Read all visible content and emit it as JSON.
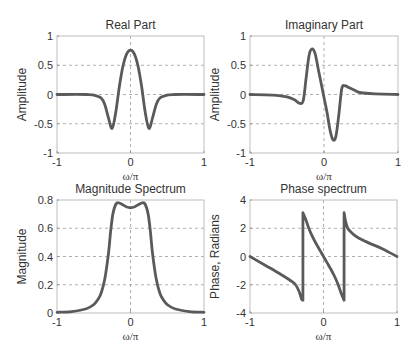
{
  "chart_data": [
    {
      "type": "line",
      "title": "Real Part",
      "xlabel": "ω/π",
      "ylabel": "Amplitude",
      "xlim": [
        -1,
        1
      ],
      "ylim": [
        -1,
        1
      ],
      "xticks": [
        -1,
        0,
        1
      ],
      "yticks": [
        -1,
        -0.5,
        0,
        0.5,
        1
      ],
      "ytick_labels": [
        "-1",
        "-0.5",
        "0",
        "0.5",
        "1"
      ],
      "xtick_labels": [
        "-1",
        "0",
        "1"
      ],
      "grid": true,
      "series": [
        {
          "name": "real",
          "x": [
            -1,
            -0.6,
            -0.5,
            -0.4,
            -0.35,
            -0.3,
            -0.25,
            -0.2,
            -0.15,
            -0.1,
            -0.05,
            0,
            0.05,
            0.1,
            0.15,
            0.2,
            0.25,
            0.3,
            0.35,
            0.4,
            0.5,
            0.6,
            1
          ],
          "y": [
            0,
            0,
            -0.01,
            -0.06,
            -0.17,
            -0.4,
            -0.58,
            -0.3,
            0.15,
            0.5,
            0.7,
            0.76,
            0.7,
            0.5,
            0.15,
            -0.3,
            -0.58,
            -0.4,
            -0.17,
            -0.06,
            -0.01,
            0,
            0
          ]
        }
      ]
    },
    {
      "type": "line",
      "title": "Imaginary Part",
      "xlabel": "ω/π",
      "ylabel": "Amplitude",
      "xlim": [
        -1,
        1
      ],
      "ylim": [
        -1,
        1
      ],
      "xticks": [
        -1,
        0,
        1
      ],
      "yticks": [
        -1,
        -0.5,
        0,
        0.5,
        1
      ],
      "ytick_labels": [
        "-1",
        "-0.5",
        "0",
        "0.5",
        "1"
      ],
      "xtick_labels": [
        "-1",
        "0",
        "1"
      ],
      "grid": true,
      "series": [
        {
          "name": "imag",
          "x": [
            -1,
            -0.7,
            -0.5,
            -0.4,
            -0.33,
            -0.28,
            -0.24,
            -0.2,
            -0.16,
            -0.12,
            -0.08,
            -0.04,
            0,
            0.04,
            0.08,
            0.12,
            0.16,
            0.2,
            0.24,
            0.28,
            0.32,
            0.4,
            0.5,
            0.7,
            1
          ],
          "y": [
            0,
            -0.01,
            -0.04,
            -0.09,
            -0.15,
            -0.1,
            0.3,
            0.68,
            0.78,
            0.7,
            0.45,
            0.2,
            -0.05,
            -0.3,
            -0.6,
            -0.77,
            -0.72,
            -0.35,
            0.1,
            0.15,
            0.13,
            0.08,
            0.03,
            0.01,
            0
          ]
        }
      ]
    },
    {
      "type": "line",
      "title": "Magnitude Spectrum",
      "xlabel": "ω/π",
      "ylabel": "Magnitude",
      "xlim": [
        -1,
        1
      ],
      "ylim": [
        0,
        0.8
      ],
      "xticks": [
        -1,
        0,
        1
      ],
      "yticks": [
        0,
        0.2,
        0.4,
        0.6,
        0.8
      ],
      "ytick_labels": [
        "0",
        "0.2",
        "0.4",
        "0.6",
        "0.8"
      ],
      "xtick_labels": [
        "-1",
        "0",
        "1"
      ],
      "grid": true,
      "series": [
        {
          "name": "magnitude",
          "x": [
            -1,
            -0.8,
            -0.6,
            -0.5,
            -0.45,
            -0.4,
            -0.35,
            -0.3,
            -0.27,
            -0.24,
            -0.2,
            -0.16,
            -0.1,
            -0.05,
            0,
            0.05,
            0.1,
            0.16,
            0.2,
            0.24,
            0.27,
            0.3,
            0.35,
            0.4,
            0.45,
            0.5,
            0.6,
            0.8,
            1
          ],
          "y": [
            0.005,
            0.01,
            0.03,
            0.06,
            0.09,
            0.14,
            0.24,
            0.42,
            0.58,
            0.7,
            0.77,
            0.78,
            0.765,
            0.75,
            0.745,
            0.75,
            0.765,
            0.78,
            0.77,
            0.7,
            0.58,
            0.42,
            0.24,
            0.14,
            0.09,
            0.06,
            0.03,
            0.01,
            0.005
          ]
        }
      ]
    },
    {
      "type": "line",
      "title": "Phase spectrum",
      "xlabel": "ω/π",
      "ylabel": "Phase, Radians",
      "xlim": [
        -1,
        1
      ],
      "ylim": [
        -4,
        4
      ],
      "xticks": [
        -1,
        0,
        1
      ],
      "yticks": [
        -4,
        -2,
        0,
        2,
        4
      ],
      "ytick_labels": [
        "-4",
        "-2",
        "0",
        "2",
        "4"
      ],
      "xtick_labels": [
        "-1",
        "0",
        "1"
      ],
      "grid": true,
      "series": [
        {
          "name": "phase",
          "x": [
            -1,
            -0.8,
            -0.6,
            -0.45,
            -0.38,
            -0.33,
            -0.3,
            -0.28,
            -0.28,
            -0.24,
            -0.2,
            -0.15,
            -0.1,
            -0.05,
            0,
            0.05,
            0.1,
            0.15,
            0.2,
            0.24,
            0.28,
            0.28,
            0.3,
            0.33,
            0.38,
            0.45,
            0.6,
            0.8,
            1
          ],
          "y": [
            0,
            -0.6,
            -1.2,
            -1.7,
            -2.0,
            -2.5,
            -3.0,
            -3.1,
            3.1,
            2.6,
            2.0,
            1.4,
            0.9,
            0.45,
            0,
            -0.45,
            -0.9,
            -1.4,
            -2.0,
            -2.6,
            -3.1,
            3.1,
            2.5,
            2.0,
            1.7,
            1.4,
            1.0,
            0.55,
            0
          ]
        }
      ]
    }
  ]
}
